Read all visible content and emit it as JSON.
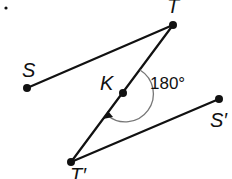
{
  "diagram": {
    "points": {
      "S": {
        "label": "S"
      },
      "T": {
        "label": "T"
      },
      "K": {
        "label": "K"
      },
      "S_prime": {
        "label": "S′"
      },
      "T_prime": {
        "label": "T′"
      }
    },
    "segments": [
      {
        "from": "S",
        "to": "T"
      },
      {
        "from": "T",
        "to": "T_prime"
      },
      {
        "from": "T_prime",
        "to": "S_prime"
      }
    ],
    "rotation": {
      "center": "K",
      "angle_label": "180°",
      "angle_degrees": 180,
      "direction": "clockwise"
    },
    "marker": "•"
  }
}
